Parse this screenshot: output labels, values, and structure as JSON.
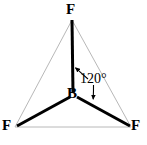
{
  "figure": {
    "name": "boron-trifluoride-trigonal-planar-structure",
    "background_color": "#ffffff",
    "width": 147,
    "height": 145
  },
  "atoms": {
    "center": {
      "symbol": "B",
      "element_name": "boron",
      "x": 73,
      "y": 95,
      "color": "#000000"
    },
    "top": {
      "symbol": "F",
      "element_name": "fluorine",
      "x": 72,
      "y": 18,
      "color": "#000000"
    },
    "bottom_left": {
      "symbol": "F",
      "element_name": "fluorine",
      "x": 14,
      "y": 128,
      "color": "#000000"
    },
    "bottom_right": {
      "symbol": "F",
      "element_name": "fluorine",
      "x": 133,
      "y": 128,
      "color": "#000000"
    }
  },
  "bonds": {
    "color": "#000000",
    "width": 3,
    "list": [
      {
        "name": "bond-b-f-top",
        "x1": 73,
        "y1": 93,
        "x2": 72,
        "y2": 20
      },
      {
        "name": "bond-b-f-bottom-left",
        "x1": 70,
        "y1": 97,
        "x2": 17,
        "y2": 126
      },
      {
        "name": "bond-b-f-bottom-right",
        "x1": 77,
        "y1": 97,
        "x2": 130,
        "y2": 126
      }
    ]
  },
  "triangle": {
    "name": "planar-geometry-outline",
    "color": "#b8b8b8",
    "width": 1,
    "points": "72,20 131,127 15,127"
  },
  "angle_annotation": {
    "text": "120°",
    "value": 120,
    "unit": "degrees",
    "color": "#000000",
    "arrow_to_vertical_bond": {
      "name": "angle-arrow-upper",
      "path": "M 86,78 C 80,73 77,70 75,68",
      "tip": {
        "x": 73,
        "y": 67
      }
    },
    "arrow_to_right_bond": {
      "name": "angle-arrow-lower",
      "path": "M 93,85 C 93,91 93,95 93,99",
      "tip": {
        "x": 93,
        "y": 101
      }
    }
  }
}
